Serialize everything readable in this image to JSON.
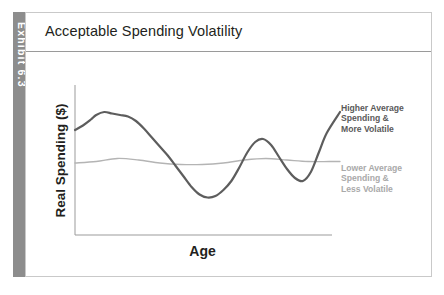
{
  "exhibit": {
    "tab_label": "Exhibit 6.3",
    "tab_color": "#8d8d8d"
  },
  "header": {
    "title": "Acceptable Spending Volatility"
  },
  "axes": {
    "y_title": "Real Spending ($)",
    "x_title": "Age"
  },
  "legend": {
    "items": [
      {
        "id": "higher-average",
        "lines": [
          "Higher Average",
          "Spending &",
          "More Volatile"
        ],
        "color": "#5a5a5a"
      },
      {
        "id": "lower-average",
        "lines": [
          "Lower Average",
          "Spending &",
          "Less Volatile"
        ],
        "color": "#a9a9a9"
      }
    ]
  },
  "chart_data": {
    "type": "line",
    "title": "Acceptable Spending Volatility",
    "xlabel": "Age",
    "ylabel": "Real Spending ($)",
    "grid": false,
    "legend_position": "right",
    "axis_ticks": {
      "x": [],
      "y": []
    },
    "xlim": [
      0,
      100
    ],
    "ylim": [
      0,
      100
    ],
    "series": [
      {
        "name": "Higher Average Spending & More Volatile",
        "color": "#5d5d5d",
        "width": 2.2,
        "x": [
          0,
          3,
          6,
          8,
          11,
          14,
          17,
          20,
          23,
          26,
          29,
          32,
          35,
          38,
          41,
          44,
          47,
          50,
          53,
          56,
          59,
          62,
          65,
          68,
          71,
          74,
          77,
          80,
          83,
          86,
          89,
          92,
          95,
          100
        ],
        "y": [
          70,
          73,
          77,
          80,
          82,
          81,
          80,
          79,
          76,
          71,
          65,
          59,
          53,
          46,
          39,
          32,
          27,
          25,
          26,
          30,
          36,
          45,
          55,
          62,
          64,
          60,
          52,
          44,
          38,
          36,
          42,
          55,
          68,
          82
        ]
      },
      {
        "name": "Lower Average Spending & Less Volatile",
        "color": "#b4b4b4",
        "width": 1.3,
        "x": [
          0,
          8,
          16,
          24,
          32,
          40,
          48,
          56,
          64,
          72,
          80,
          88,
          96,
          100
        ],
        "y": [
          48,
          49,
          51,
          50,
          48,
          47,
          47,
          48,
          50,
          51,
          50,
          49,
          49,
          49
        ]
      }
    ],
    "annotations": [
      {
        "text": "Higher Average Spending & More Volatile",
        "series": 0,
        "position": "right-top"
      },
      {
        "text": "Lower Average Spending & Less Volatile",
        "series": 1,
        "position": "right-middle"
      }
    ]
  }
}
